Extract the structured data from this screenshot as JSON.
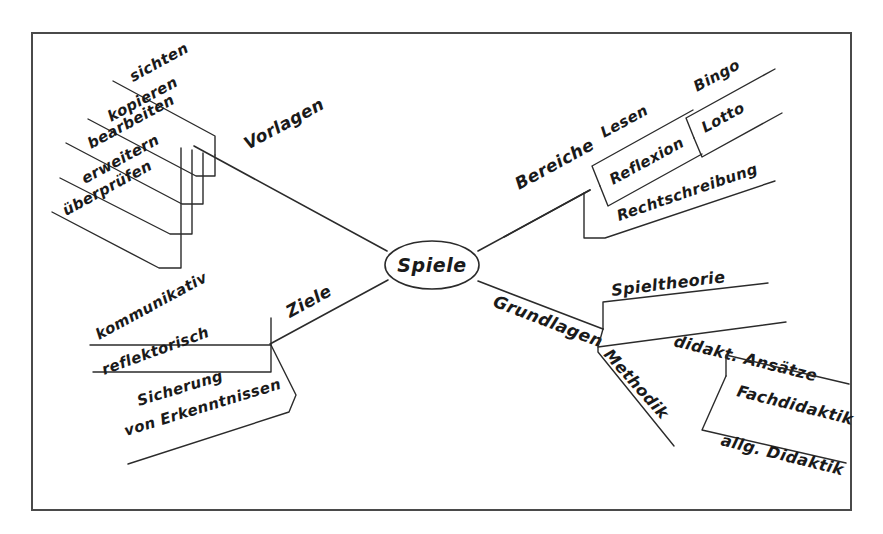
{
  "diagram": {
    "type": "mindmap",
    "language": "de",
    "frame": {
      "x": 32,
      "y": 33,
      "width": 819,
      "height": 477,
      "border_color": "#4a4a4a"
    },
    "background_color": "#ffffff",
    "ink_color": "#1a1a1a",
    "center": {
      "label": "Spiele",
      "shape": "ellipse",
      "x": 432,
      "y": 265,
      "rx": 47,
      "ry": 24
    },
    "branches": [
      {
        "id": "vorlagen",
        "label": "Vorlagen",
        "direction": "upper-left",
        "children": [
          {
            "label": "sichten"
          },
          {
            "label": "kopieren"
          },
          {
            "label": "bearbeiten"
          },
          {
            "label": "erweitern"
          },
          {
            "label": "überprüfen"
          }
        ]
      },
      {
        "id": "bereiche",
        "label": "Bereiche",
        "direction": "upper-right",
        "children": [
          {
            "label": "Lesen",
            "children": [
              {
                "label": "Bingo"
              },
              {
                "label": "Lotto"
              }
            ]
          },
          {
            "label": "Reflexion"
          },
          {
            "label": "Rechtschreibung"
          }
        ]
      },
      {
        "id": "ziele",
        "label": "Ziele",
        "direction": "lower-left",
        "children": [
          {
            "label": "kommunikativ"
          },
          {
            "label": "reflektorisch"
          },
          {
            "label": "Sicherung",
            "label_line2": "von Erkenntnissen"
          }
        ]
      },
      {
        "id": "grundlagen",
        "label": "Grundlagen",
        "direction": "lower-right",
        "children": [
          {
            "label": "Spieltheorie"
          },
          {
            "label": "didakt. Ansätze",
            "children": [
              {
                "label": "Fachdidaktik"
              },
              {
                "label": "allg. Didaktik"
              }
            ]
          },
          {
            "label": "Methodik"
          }
        ]
      }
    ]
  }
}
